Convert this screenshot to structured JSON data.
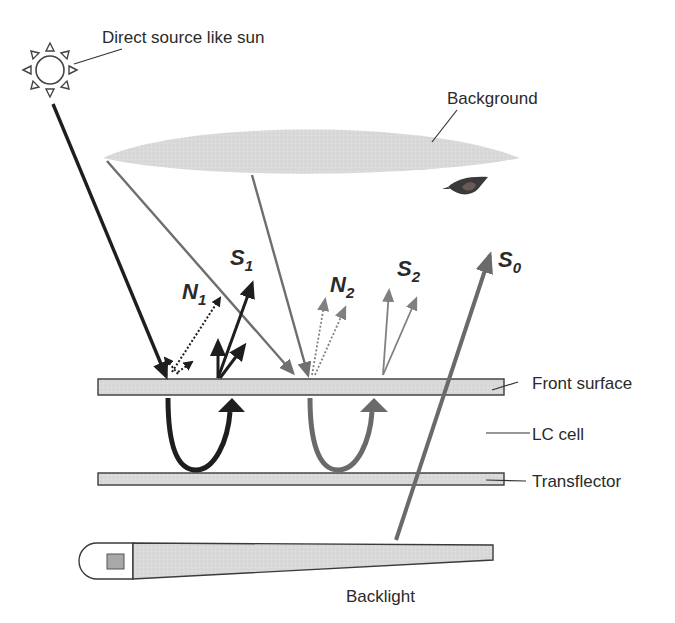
{
  "diagram": {
    "type": "transflective-display-light-paths",
    "labels": {
      "sun": "Direct source like sun",
      "background": "Background",
      "front_surface": "Front surface",
      "lc_cell": "LC cell",
      "transflector": "Transflector",
      "backlight": "Backlight"
    },
    "symbols": {
      "s0": {
        "main": "S",
        "sub": "0"
      },
      "s1": {
        "main": "S",
        "sub": "1"
      },
      "s2": {
        "main": "S",
        "sub": "2"
      },
      "n1": {
        "main": "N",
        "sub": "1"
      },
      "n2": {
        "main": "N",
        "sub": "2"
      }
    },
    "icons": [
      "sun-icon",
      "eye-icon",
      "backlight-lamp-icon"
    ],
    "colors": {
      "dark_ray": "#1e1e1e",
      "gray_ray": "#6e6e6e",
      "panel_fill": "#d6d6d6",
      "panel_stroke": "#3a3a3a",
      "background_fill": "#dcdcdc",
      "label_text": "#2a2a2a"
    }
  }
}
